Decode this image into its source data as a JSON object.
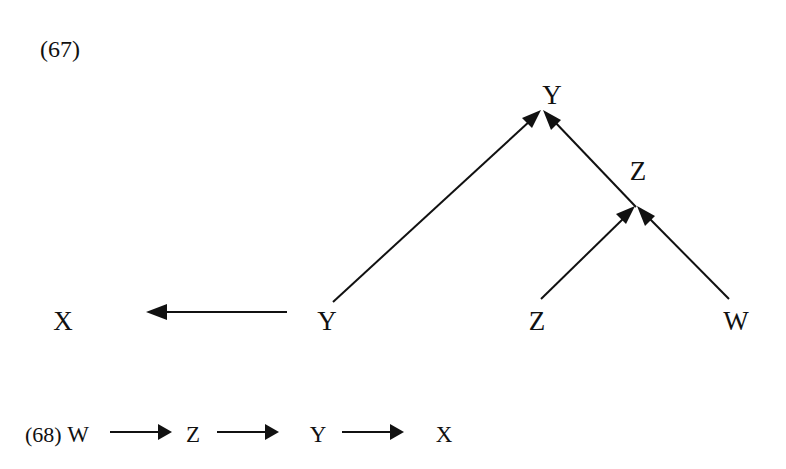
{
  "examples": [
    {
      "number": "(67)",
      "nodes": {
        "top_y": "Y",
        "mid_z": "Z",
        "x": "X",
        "y": "Y",
        "z": "Z",
        "w": "W"
      },
      "edges": [
        {
          "from": "Y",
          "to": "X",
          "direction": "left"
        },
        {
          "from": "Y",
          "to": "Y (top)",
          "direction": "up-right"
        },
        {
          "from": "Z (mid)",
          "to": "Y (top)",
          "direction": "up-left"
        },
        {
          "from": "Z",
          "to": "Z (mid)",
          "direction": "up-right"
        },
        {
          "from": "W",
          "to": "Z (mid)",
          "direction": "up-left"
        }
      ]
    },
    {
      "number": "(68)",
      "chain": [
        "W",
        "Z",
        "Y",
        "X"
      ],
      "edges": [
        {
          "from": "W",
          "to": "Z"
        },
        {
          "from": "Z",
          "to": "Y"
        },
        {
          "from": "Y",
          "to": "X"
        }
      ]
    }
  ],
  "colors": {
    "ink": "#111111",
    "background": "#ffffff"
  }
}
